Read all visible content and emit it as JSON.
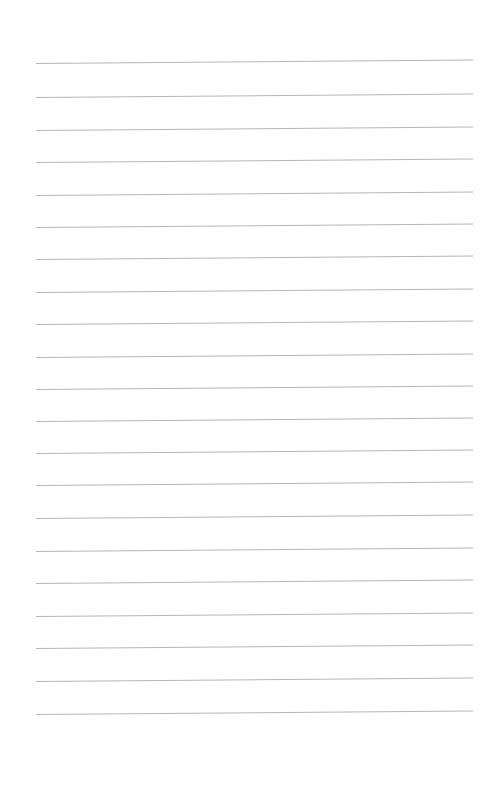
{
  "page": {
    "type": "lined-paper",
    "background_color": "#ffffff",
    "line_color": "#a9a9a9",
    "line_count": 21,
    "line_left_x": 36,
    "line_width": 437,
    "line_tilt_deg": -0.45,
    "line_y_positions": [
      63,
      97,
      130,
      162,
      195,
      227,
      259,
      292,
      324,
      357,
      389,
      421,
      453,
      485,
      518,
      551,
      583,
      616,
      648,
      681,
      714
    ]
  }
}
